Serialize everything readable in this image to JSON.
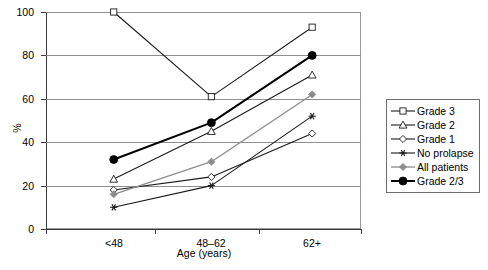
{
  "chart_data": {
    "type": "line",
    "title": "",
    "xlabel": "Age  (years)",
    "ylabel": "%",
    "categories": [
      "<48",
      "48–62",
      "62+"
    ],
    "ylim": [
      0,
      100
    ],
    "yticks": [
      0,
      20,
      40,
      60,
      80,
      100
    ],
    "grid": true,
    "legend_position": "right",
    "series": [
      {
        "name": "Grade 3",
        "values": [
          100,
          61,
          93
        ],
        "marker": "open-square",
        "color": "#1a1a1a",
        "width": 1.1
      },
      {
        "name": "Grade 2",
        "values": [
          23,
          45,
          71
        ],
        "marker": "open-triangle",
        "color": "#1a1a1a",
        "width": 1.1
      },
      {
        "name": "Grade 1",
        "values": [
          18,
          24,
          44
        ],
        "marker": "open-diamond",
        "color": "#1a1a1a",
        "width": 1.1
      },
      {
        "name": "No prolapse",
        "values": [
          10,
          20,
          52
        ],
        "marker": "asterisk",
        "color": "#1a1a1a",
        "width": 1.1
      },
      {
        "name": "All patients",
        "values": [
          16,
          31,
          62
        ],
        "marker": "solid-diamond",
        "color": "#8c8c8c",
        "width": 1.3
      },
      {
        "name": "Grade 2/3",
        "values": [
          32,
          49,
          80
        ],
        "marker": "solid-circle",
        "color": "#000000",
        "width": 2.0
      }
    ]
  },
  "axis": {
    "ytick_labels": [
      "0",
      "20",
      "40",
      "60",
      "80",
      "100"
    ],
    "xtick_labels": [
      "<48",
      "48–62",
      "62+"
    ],
    "y_title": "%",
    "x_title": "Age  (years)"
  }
}
